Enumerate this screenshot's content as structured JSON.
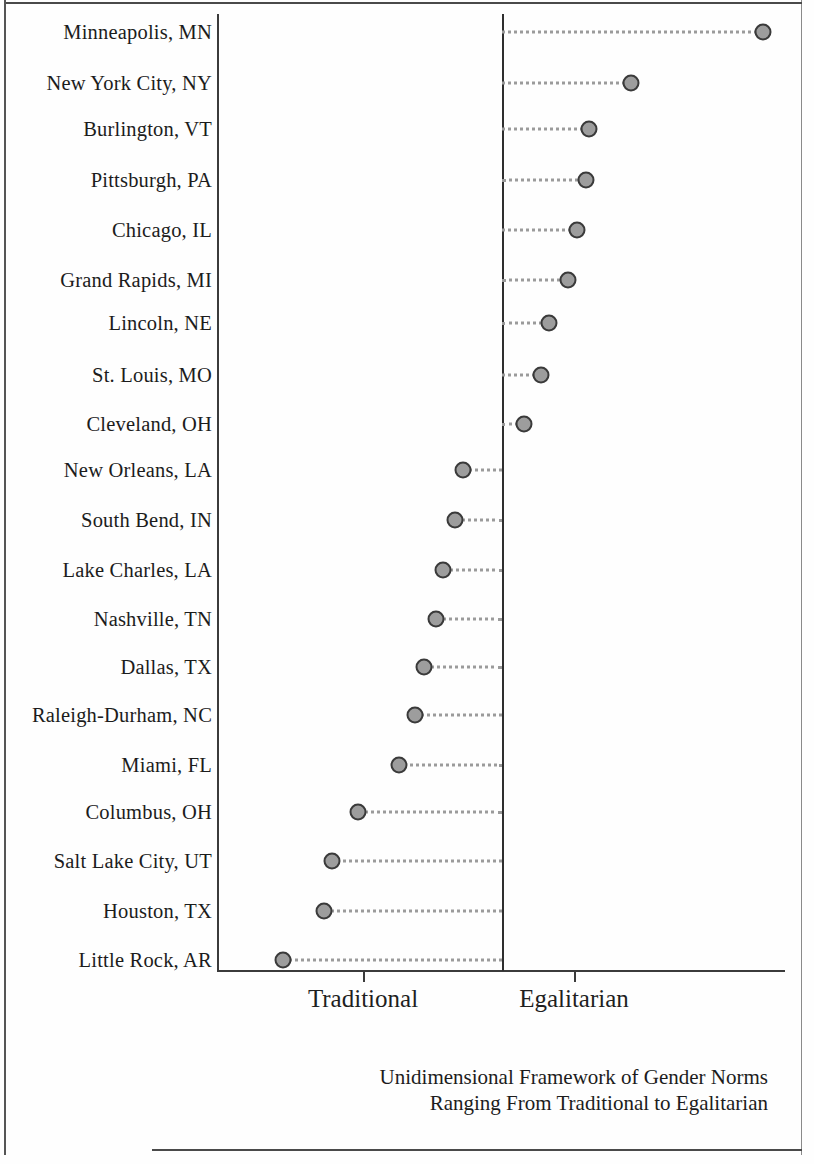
{
  "chart_data": {
    "type": "scatter",
    "title": "",
    "subtitle": "",
    "xlabel": "",
    "ylabel": "",
    "caption_lines": [
      "Unidimensional Framework of Gender Norms",
      "Ranging From Traditional to Egalitarian"
    ],
    "axis_tick_labels": [
      "Traditional",
      "Egalitarian"
    ],
    "axis_tick_values": [
      -1,
      1
    ],
    "xlim": [
      -3.1,
      2.7
    ],
    "grid": false,
    "legend": null,
    "center_reference_value": 0,
    "categories": [
      "Minneapolis, MN",
      "New York City, NY",
      "Burlington, VT",
      "Pittsburgh, PA",
      "Chicago, IL",
      "Grand Rapids, MI",
      "Lincoln, NE",
      "St. Louis, MO",
      "Cleveland, OH",
      "New Orleans, LA",
      "South Bend, IN",
      "Lake Charles, LA",
      "Nashville, TN",
      "Dallas, TX",
      "Raleigh-Durham, NC",
      "Miami, FL",
      "Columbus, OH",
      "Salt Lake City, UT",
      "Houston, TX",
      "Little Rock, AR"
    ],
    "values": [
      2.48,
      1.25,
      0.83,
      0.8,
      0.71,
      0.62,
      0.45,
      0.37,
      0.21,
      -0.37,
      -0.45,
      -0.56,
      -0.63,
      -0.74,
      -0.83,
      -0.98,
      -1.37,
      -1.62,
      -1.69,
      -2.08
    ],
    "pixel_positions": {
      "center_line_x": 502,
      "tick_traditional_x": 363,
      "tick_egalitarian_x": 574,
      "row_y": [
        32,
        83,
        129,
        180,
        230,
        280,
        323,
        375,
        424,
        470,
        520,
        570,
        619,
        667,
        715,
        765,
        812,
        861,
        911,
        960
      ],
      "dot_x": [
        763,
        631,
        589,
        586,
        577,
        568,
        549,
        541,
        524,
        463,
        455,
        443,
        436,
        424,
        415,
        399,
        358,
        332,
        324,
        283
      ]
    }
  }
}
